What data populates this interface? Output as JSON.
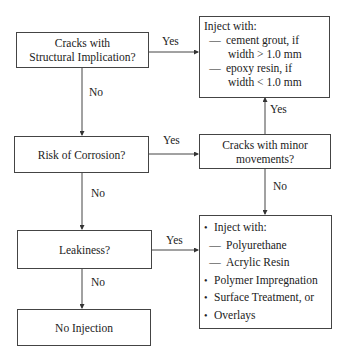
{
  "nodes": {
    "structural": {
      "line1": "Cracks with",
      "line2": "Structural Implication?"
    },
    "inject_top": {
      "title": "Inject with:",
      "items": [
        {
          "dash": "—",
          "line1": "cement grout, if",
          "line2": "width  > 1.0 mm"
        },
        {
          "dash": "—",
          "line1": "epoxy resin, if",
          "line2": "width  < 1.0 mm"
        }
      ]
    },
    "corrosion": {
      "text": "Risk of Corrosion?"
    },
    "minor": {
      "line1": "Cracks with minor",
      "line2": "movements?"
    },
    "leakiness": {
      "text": "Leakiness?"
    },
    "no_injection": {
      "text": "No Injection"
    },
    "inject_bottom": {
      "bullet": "•",
      "title": "Inject with:",
      "subitems": [
        {
          "dash": "—",
          "text": "Polyurethane"
        },
        {
          "dash": "—",
          "text": "Acrylic Resin"
        }
      ],
      "items": [
        "Polymer Impregnation",
        "Surface Treatment, or",
        "Overlays"
      ]
    }
  },
  "edges": {
    "structural_yes": "Yes",
    "structural_no": "No",
    "corrosion_yes": "Yes",
    "corrosion_no": "No",
    "minor_yes": "Yes",
    "minor_no": "No",
    "leak_yes": "Yes",
    "leak_no": "No"
  }
}
